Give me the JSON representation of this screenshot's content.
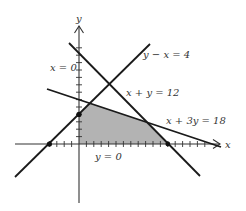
{
  "figure": {
    "type": "linear-programming-feasible-region",
    "axes": {
      "x_label": "x",
      "y_label": "y",
      "origin_px": [
        79,
        144
      ],
      "unit_px": 7.4,
      "x_ticks": [
        -4,
        -3,
        -2,
        -1,
        1,
        2,
        3,
        4,
        5,
        6,
        7,
        8,
        9,
        10,
        11,
        12,
        13,
        14,
        15,
        16,
        17
      ],
      "y_ticks": [
        1,
        2,
        3,
        4,
        5,
        6,
        7,
        8,
        9,
        10,
        11,
        12,
        13
      ]
    },
    "constraint_lines": [
      {
        "id": "line-y-minus-x",
        "label": "y − x = 4"
      },
      {
        "id": "line-x-plus-y",
        "label": "x + y = 12"
      },
      {
        "id": "line-x-plus-3y",
        "label": "x + 3y = 18"
      }
    ],
    "axis_labels": {
      "x_eq_0": "x = 0",
      "y_eq_0": "y = 0"
    },
    "feasible_region": {
      "vertices": [
        [
          0,
          0
        ],
        [
          0,
          4
        ],
        [
          1.5,
          5.5
        ],
        [
          9,
          3
        ],
        [
          12,
          0
        ]
      ],
      "fill": "#b3b3b3"
    },
    "marked_points": [
      [
        -4,
        0
      ],
      [
        0,
        4
      ],
      [
        12,
        0
      ]
    ],
    "colors": {
      "line": "#1a1a1a",
      "axis": "#333333",
      "region": "#b3b3b3"
    }
  }
}
